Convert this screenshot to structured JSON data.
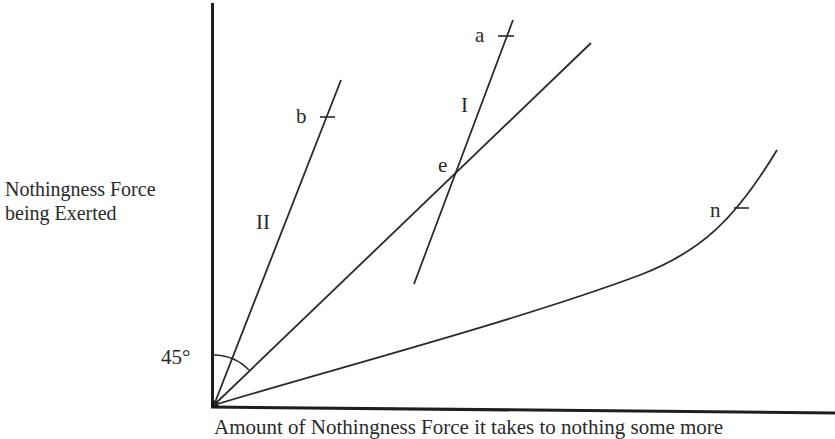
{
  "axes": {
    "y_label_line1": "Nothingness Force",
    "y_label_line2": "being Exerted",
    "x_label": "Amount of Nothingness Force it takes to nothing some more"
  },
  "angle": {
    "label": "45°"
  },
  "lines": {
    "line_I": {
      "label": "I",
      "marked_point": "a"
    },
    "line_II": {
      "label": "II",
      "marked_point": "b"
    },
    "diagonal_45": {
      "label": "45° line"
    },
    "curve_n": {
      "marked_point": "n"
    }
  },
  "points": {
    "a": "a",
    "b": "b",
    "e": "e",
    "n": "n"
  },
  "colors": {
    "ink": "#222222",
    "background": "#ffffff"
  }
}
